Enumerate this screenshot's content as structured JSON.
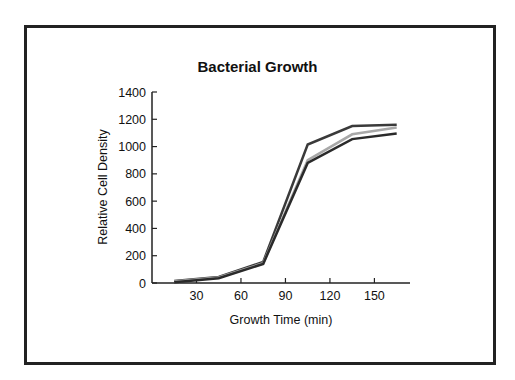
{
  "chart_data": {
    "type": "line",
    "title": "Bacterial Growth",
    "xlabel": "Growth Time (min)",
    "ylabel": "Relative Cell Density",
    "x": [
      15,
      45,
      75,
      105,
      135,
      165
    ],
    "xticks": [
      30,
      60,
      90,
      120,
      150
    ],
    "yticks": [
      0,
      200,
      400,
      600,
      800,
      1000,
      1200,
      1400
    ],
    "xlim": [
      0,
      174
    ],
    "ylim": [
      0,
      1400
    ],
    "grid": false,
    "legend": null,
    "series": [
      {
        "name": "Series 1",
        "color": "#3a3a3a",
        "values": [
          15,
          45,
          155,
          1015,
          1150,
          1160
        ]
      },
      {
        "name": "Series 2",
        "color": "#a8a8a8",
        "values": [
          10,
          40,
          145,
          900,
          1090,
          1140
        ]
      },
      {
        "name": "Series 3",
        "color": "#2a2a2a",
        "values": [
          5,
          35,
          140,
          880,
          1055,
          1095
        ]
      }
    ]
  }
}
